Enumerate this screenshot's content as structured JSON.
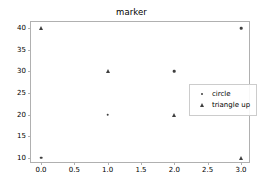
{
  "chart_data": {
    "type": "scatter",
    "title": "marker",
    "xlabel": "",
    "ylabel": "",
    "xlim": [
      -0.15,
      3.15
    ],
    "ylim": [
      8.5,
      41.5
    ],
    "grid": false,
    "legend_position": "center right",
    "xticks": [
      "0.0",
      "0.5",
      "1.0",
      "1.5",
      "2.0",
      "2.5",
      "3.0"
    ],
    "xtick_values": [
      0.0,
      0.5,
      1.0,
      1.5,
      2.0,
      2.5,
      3.0
    ],
    "yticks": [
      "10",
      "15",
      "20",
      "25",
      "30",
      "35",
      "40"
    ],
    "ytick_values": [
      10,
      15,
      20,
      25,
      30,
      35,
      40
    ],
    "marker_color": "#3f3f3f",
    "series": [
      {
        "name": "circle",
        "marker": "circle",
        "x": [
          0,
          1,
          2,
          3
        ],
        "values": [
          10,
          20,
          30,
          40
        ]
      },
      {
        "name": "triangle up",
        "marker": "triangle-up",
        "x": [
          0,
          1,
          2,
          3
        ],
        "values": [
          40,
          30,
          20,
          10
        ]
      }
    ]
  }
}
